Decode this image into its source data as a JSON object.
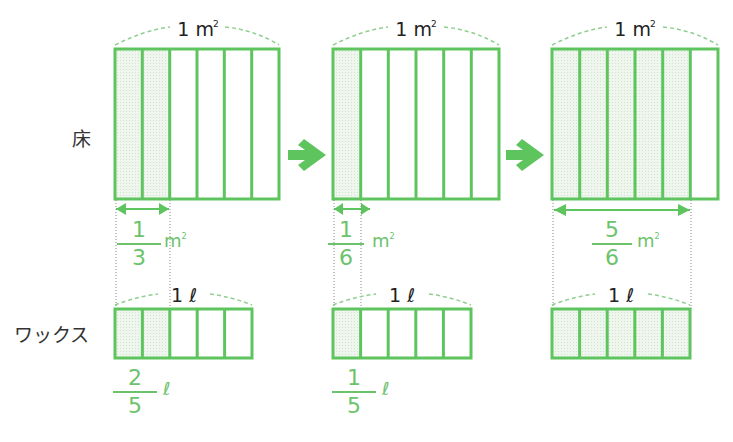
{
  "colors": {
    "accent": "#5ec45e",
    "fill": "#e8f3e8",
    "dashed": "#8fcf8f",
    "text": "#222222"
  },
  "rows": {
    "floor_label": "床",
    "wax_label": "ワックス"
  },
  "floor": {
    "unit": "1 m",
    "unit_sup": "2",
    "panels": [
      {
        "divisions": 6,
        "shaded": 2,
        "fraction": {
          "num": "1",
          "den": "3"
        },
        "unit": "m",
        "unit_sup": "2"
      },
      {
        "divisions": 6,
        "shaded": 1,
        "fraction": {
          "num": "1",
          "den": "6"
        },
        "unit": "m",
        "unit_sup": "2"
      },
      {
        "divisions": 6,
        "shaded": 5,
        "fraction": {
          "num": "5",
          "den": "6"
        },
        "unit": "m",
        "unit_sup": "2"
      }
    ]
  },
  "wax": {
    "unit": "1 ℓ",
    "panels": [
      {
        "divisions": 5,
        "shaded": 2,
        "fraction": {
          "num": "2",
          "den": "5"
        },
        "unit": "ℓ"
      },
      {
        "divisions": 5,
        "shaded": 1,
        "fraction": {
          "num": "1",
          "den": "5"
        },
        "unit": "ℓ"
      },
      {
        "divisions": 5,
        "shaded": 5
      }
    ]
  },
  "arrows": [
    "arrow-right",
    "arrow-right"
  ]
}
